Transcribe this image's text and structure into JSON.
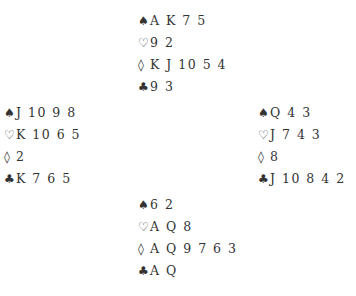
{
  "deal": {
    "north": {
      "spades": {
        "symbol": "♠",
        "cards": "A K 7 5"
      },
      "hearts": {
        "symbol": "♡",
        "cards": "9 2"
      },
      "diamonds": {
        "symbol": "◊",
        "cards": "K J 10 5 4"
      },
      "clubs": {
        "symbol": "♣",
        "cards": "9 3"
      }
    },
    "west": {
      "spades": {
        "symbol": "♠",
        "cards": "J 10 9 8"
      },
      "hearts": {
        "symbol": "♡",
        "cards": "K 10 6 5"
      },
      "diamonds": {
        "symbol": "◊",
        "cards": "2"
      },
      "clubs": {
        "symbol": "♣",
        "cards": "K 7 6 5"
      }
    },
    "east": {
      "spades": {
        "symbol": "♠",
        "cards": "Q 4 3"
      },
      "hearts": {
        "symbol": "♡",
        "cards": "J 7 4 3"
      },
      "diamonds": {
        "symbol": "◊",
        "cards": "8"
      },
      "clubs": {
        "symbol": "♣",
        "cards": "J 10 8 4 2"
      }
    },
    "south": {
      "spades": {
        "symbol": "♠",
        "cards": "6 2"
      },
      "hearts": {
        "symbol": "♡",
        "cards": "A Q 8"
      },
      "diamonds": {
        "symbol": "◊",
        "cards": "A Q 9 7 6 3"
      },
      "clubs": {
        "symbol": "♣",
        "cards": "A Q"
      }
    }
  }
}
